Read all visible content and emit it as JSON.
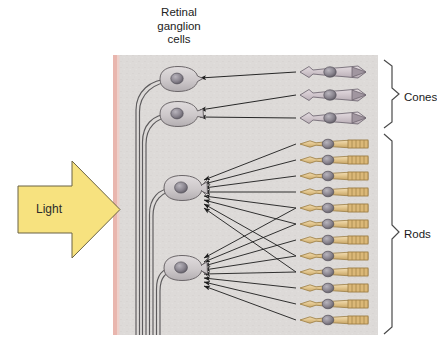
{
  "figure": {
    "title_lines": [
      "Retinal",
      "ganglion",
      "cells"
    ],
    "title_text": "Retinal ganglion cells",
    "background": "#ffffff",
    "panel_background": "#dcd8d6",
    "panel_edge_color": "#e9b8b2"
  },
  "light_arrow": {
    "label": "Light",
    "fill": "#f7e27f",
    "stroke": "#6e6545",
    "direction": "right"
  },
  "brackets": [
    {
      "name": "cones-bracket",
      "label": "Cones",
      "top": 60,
      "bottom": 128
    },
    {
      "name": "rods-bracket",
      "label": "Rods",
      "top": 134,
      "bottom": 334
    }
  ],
  "ganglion_cells": {
    "count": 4,
    "body_fill": "#cfcbcd",
    "nucleus_fill": "#8f8b93",
    "cells": [
      {
        "id": "ganglion-1",
        "cx": 178,
        "cy": 79,
        "inputs": 1,
        "type": "cone-driven"
      },
      {
        "id": "ganglion-2",
        "cx": 178,
        "cy": 114,
        "inputs": 2,
        "type": "cone-driven"
      },
      {
        "id": "ganglion-3",
        "cx": 184,
        "cy": 188,
        "inputs": 6,
        "type": "rod-driven"
      },
      {
        "id": "ganglion-4",
        "cx": 184,
        "cy": 268,
        "inputs": 6,
        "type": "rod-driven"
      }
    ],
    "axon_bundle_count": 4
  },
  "photoreceptors": {
    "cones": {
      "label": "Cones",
      "count": 3,
      "body_fill": "#d6ccd2",
      "outer_segment_fill": "#a79aa4",
      "nucleus_fill": "#6f6a74",
      "rows_y": [
        72,
        95,
        118
      ]
    },
    "rods": {
      "label": "Rods",
      "count": 12,
      "body_fill": "#e3c68f",
      "outer_segment_fill": "#d9b978",
      "nucleus_fill": "#9a968f",
      "rows_y": [
        144,
        160,
        176,
        192,
        208,
        224,
        240,
        256,
        272,
        288,
        304,
        320
      ]
    }
  },
  "connections": {
    "arrow_color": "#1c1c1c",
    "description": "Each cone connects to one ganglion cell; many rods converge on each rod-driven ganglion cell",
    "cone_to_ganglion": [
      {
        "from_row": 0,
        "to_cell": 0
      },
      {
        "from_row": 1,
        "to_cell": 1
      },
      {
        "from_row": 2,
        "to_cell": 1
      }
    ],
    "rod_to_ganglion": [
      {
        "from_row": 0,
        "to_cell": 2
      },
      {
        "from_row": 1,
        "to_cell": 2
      },
      {
        "from_row": 2,
        "to_cell": 2
      },
      {
        "from_row": 3,
        "to_cell": 2
      },
      {
        "from_row": 4,
        "to_cell": 2
      },
      {
        "from_row": 5,
        "to_cell": 2
      },
      {
        "from_row": 6,
        "to_cell": 3
      },
      {
        "from_row": 7,
        "to_cell": 3
      },
      {
        "from_row": 8,
        "to_cell": 3
      },
      {
        "from_row": 9,
        "to_cell": 3
      },
      {
        "from_row": 10,
        "to_cell": 3
      },
      {
        "from_row": 11,
        "to_cell": 3
      },
      {
        "from_row": 4,
        "to_cell": 3
      },
      {
        "from_row": 5,
        "to_cell": 3
      },
      {
        "from_row": 6,
        "to_cell": 2
      },
      {
        "from_row": 7,
        "to_cell": 2
      }
    ]
  }
}
